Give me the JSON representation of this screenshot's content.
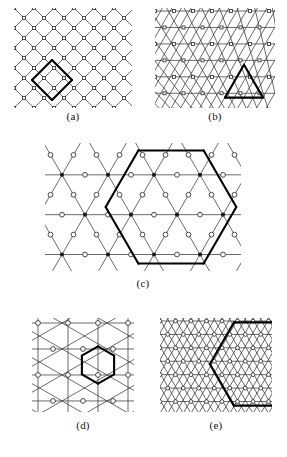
{
  "figure": {
    "type": "scientific-figure",
    "background": "#ffffff",
    "line_color": "#3a3a3a",
    "bold_color": "#000000",
    "node_fill": "#ffffff",
    "node_stroke": "#2b2b2b",
    "dot_fill": "#1a1a1a"
  },
  "panels": [
    {
      "id": "a",
      "caption": "(a)",
      "lattice": "square lattice rotated 45 degrees",
      "node_shape": "small open square",
      "highlight": "bold diamond (rotated square) spanning two lattice spacings, lower-left region",
      "width": 118,
      "height": 100,
      "cols": 6,
      "rows": 6,
      "spacing": 20
    },
    {
      "id": "b",
      "caption": "(b)",
      "lattice": "triangular lattice (horizontal rows plus two diagonal families)",
      "node_shape": "small open square",
      "highlight": "bold equilateral triangle, lower-right region, side of two lattice spacings",
      "width": 120,
      "height": 100,
      "cols": 7,
      "rows": 6,
      "spacing": 20
    },
    {
      "id": "c",
      "caption": "(c)",
      "lattice": "decorated triangular / kagome-like lattice with three-coordinate and six-coordinate sites",
      "node_shape": "open circles at three-coordinate sites, filled dots at six-coordinate sites",
      "highlight": "large bold hexagon occupying the right half of the panel",
      "width": 196,
      "height": 128,
      "cols": 5,
      "rows": 5,
      "spacing": 44
    },
    {
      "id": "d",
      "caption": "(d)",
      "lattice": "triangular lattice",
      "node_shape": "small open circle",
      "highlight": "bold hexagon of one lattice spacing, centre-right",
      "width": 102,
      "height": 94,
      "cols": 4,
      "rows": 4,
      "spacing": 30
    },
    {
      "id": "e",
      "caption": "(e)",
      "lattice": "fine triangular lattice",
      "node_shape": "small open circle",
      "highlight": "large bold hexagon extending beyond the right edge of the panel",
      "width": 112,
      "height": 94,
      "cols": 8,
      "rows": 7,
      "spacing": 15
    }
  ],
  "captions": {
    "a": "(a)",
    "b": "(b)",
    "c": "(c)",
    "d": "(d)",
    "e": "(e)"
  }
}
